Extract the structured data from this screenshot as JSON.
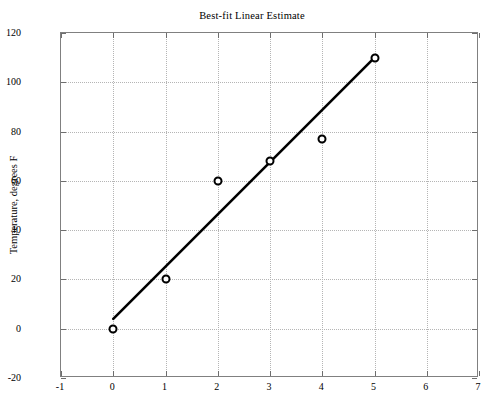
{
  "chart_data": {
    "type": "scatter",
    "title": "Best-fit Linear Estimate",
    "xlabel": "",
    "ylabel": "Temperature, degrees F",
    "xlim": [
      -1,
      7
    ],
    "ylim": [
      -20,
      120
    ],
    "grid": true,
    "legend": "none",
    "x": [
      0,
      1,
      2,
      3,
      4,
      5
    ],
    "values": [
      0,
      20,
      60,
      68,
      77,
      110
    ],
    "series": [
      {
        "name": "Measured data",
        "marker": "open-circle",
        "color": "#000000",
        "x": [
          0,
          1,
          2,
          3,
          4,
          5
        ],
        "values": [
          0,
          20,
          60,
          68,
          77,
          110
        ]
      },
      {
        "name": "Best-fit line",
        "type": "line",
        "color": "#000000",
        "x": [
          0,
          5
        ],
        "values": [
          4,
          110
        ]
      }
    ],
    "xticks": [
      "-1",
      "0",
      "1",
      "2",
      "3",
      "4",
      "5",
      "6",
      "7"
    ],
    "xtick_values": [
      -1,
      0,
      1,
      2,
      3,
      4,
      5,
      6,
      7
    ],
    "yticks": [
      "-20",
      "0",
      "20",
      "40",
      "60",
      "80",
      "100",
      "120"
    ],
    "ytick_values": [
      -20,
      0,
      20,
      40,
      60,
      80,
      100,
      120
    ]
  },
  "figure": {
    "background_color": "#ffffff",
    "axes_color": "#808080",
    "grid_color": "#b5b5b5",
    "data_color": "#000000"
  }
}
